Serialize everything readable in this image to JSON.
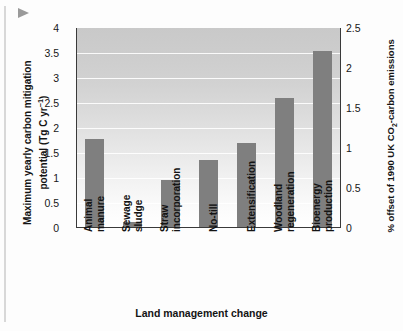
{
  "chart_data": {
    "type": "bar",
    "title": "",
    "categories": [
      "Animal manure",
      "Sewage sludge",
      "Straw incorporation",
      "No-till",
      "Extensification",
      "Woodland regeneration",
      "Bioenergy production"
    ],
    "category_lines": [
      [
        "Animal",
        "manure"
      ],
      [
        "Sewage",
        "sludge"
      ],
      [
        "Straw",
        "incorporation"
      ],
      [
        "No-till"
      ],
      [
        "Extensification"
      ],
      [
        "Woodland",
        "regeneration"
      ],
      [
        "Bioenergy",
        "production"
      ]
    ],
    "values": [
      1.79,
      0.12,
      0.97,
      1.36,
      1.7,
      2.6,
      3.55
    ],
    "xlabel": "Land management change",
    "ylabel": "Maximum yearly carbon mitigation potential (Tg C yr−1)",
    "ylabel_line1": "Maximum yearly carbon mitigation",
    "ylabel_line2_pre": "potential (Tg C yr",
    "ylabel_line2_sup": "−1",
    "ylabel_line2_post": ")",
    "ylabel_right_line1_pre": "% offset of 1990 UK CO",
    "ylabel_right_line1_sub": "2",
    "ylabel_right_line1_post": "-carbon",
    "ylabel_right_line2": "emissions",
    "ylabel_right": "% offset of 1990 UK CO2-carbon emissions",
    "ylim": [
      0,
      4
    ],
    "ylim_right": [
      0,
      2.5
    ],
    "yticks": [
      "0",
      "0.5",
      "1",
      "1.5",
      "2",
      "2.5",
      "3",
      "3.5",
      "4"
    ],
    "ytick_values": [
      0,
      0.5,
      1,
      1.5,
      2,
      2.5,
      3,
      3.5,
      4
    ],
    "yticks_right": [
      "0",
      "0.5",
      "1",
      "1.5",
      "2",
      "2.5"
    ],
    "ytick_values_right": [
      0,
      0.5,
      1,
      1.5,
      2,
      2.5
    ],
    "grid": true,
    "gridline_color": "#ffffff",
    "bar_color": "#7f7f7f",
    "axis_color": "#3a3a3a",
    "legend": "none"
  },
  "page": {
    "background_color": "#fdfdfd",
    "pointer_icon": "cursor-arrow-icon"
  }
}
